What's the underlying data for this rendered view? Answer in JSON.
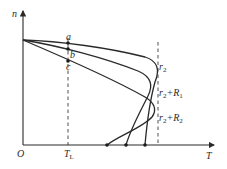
{
  "diagram": {
    "type": "characteristic-curves",
    "axes": {
      "y_label": "n",
      "x_label": "T",
      "origin_label": "O"
    },
    "reference_lines": {
      "load_torque": {
        "label": "T",
        "subscript": "L"
      }
    },
    "operating_points": [
      {
        "label": "a"
      },
      {
        "label": "b"
      },
      {
        "label": "c"
      }
    ],
    "curves": [
      {
        "label_base": "r",
        "label_sub": "2",
        "label_extra": "",
        "label_extra_sub": ""
      },
      {
        "label_base": "r",
        "label_sub": "2",
        "label_extra": "+R",
        "label_extra_sub": "1"
      },
      {
        "label_base": "r",
        "label_sub": "2",
        "label_extra": "+R",
        "label_extra_sub": "2"
      }
    ],
    "colors": {
      "line": "#2a2a2a",
      "background": "#ffffff"
    }
  }
}
